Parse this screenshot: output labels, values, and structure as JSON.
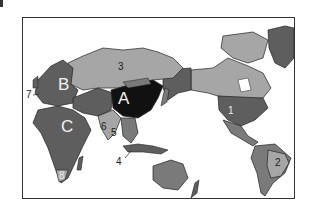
{
  "colors": {
    "frame": "#333333",
    "ocean": "#ffffff",
    "dark": "#111111",
    "mid_dark": "#5e5e5e",
    "mid": "#7a7a7a",
    "light": "#a6a6a6",
    "lightest": "#c4c4c4"
  },
  "map": {
    "projection": "Pacific-centered world map",
    "region_labels": [
      {
        "id": "A",
        "text": "A",
        "location": "China"
      },
      {
        "id": "B",
        "text": "B",
        "location": "Europe"
      },
      {
        "id": "C",
        "text": "C",
        "location": "Africa"
      }
    ],
    "number_labels": [
      {
        "id": "1",
        "text": "1",
        "location": "United States"
      },
      {
        "id": "2",
        "text": "2",
        "location": "Brazil"
      },
      {
        "id": "3",
        "text": "3",
        "location": "Russia"
      },
      {
        "id": "4",
        "text": "4",
        "location": "Indonesia / Southeast Asia"
      },
      {
        "id": "5",
        "text": "5",
        "location": "Southeast Asia (Indochina)"
      },
      {
        "id": "6",
        "text": "6",
        "location": "India"
      },
      {
        "id": "7",
        "text": "7",
        "location": "Western Europe / Atlantic coast"
      },
      {
        "id": "8",
        "text": "8",
        "location": "South Africa"
      }
    ]
  }
}
